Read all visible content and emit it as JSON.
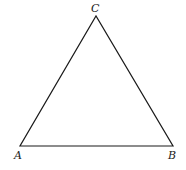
{
  "diagram": {
    "type": "triangle",
    "stroke_color": "#1a1a1a",
    "vertices": {
      "A": {
        "label": "A",
        "x": 20,
        "y": 146
      },
      "B": {
        "label": "B",
        "x": 173,
        "y": 146
      },
      "C": {
        "label": "C",
        "x": 96,
        "y": 16
      }
    },
    "labels": {
      "A": "A",
      "B": "B",
      "C": "C"
    }
  }
}
